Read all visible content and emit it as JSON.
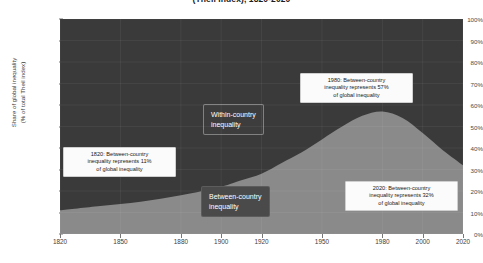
{
  "chart_data": {
    "type": "area",
    "title": "(Theil index), 1820-2020",
    "xlabel": "",
    "ylabel": "Share of global inequality (% of total Theil index)",
    "ylabel_line1": "Share of global inequality",
    "ylabel_line2": "(% of total Theil index)",
    "xlim": [
      1820,
      2020
    ],
    "ylim": [
      0,
      100
    ],
    "grid": true,
    "legend_position": "in-plot",
    "x_ticks": [
      "1820",
      "1850",
      "1880",
      "1900",
      "1920",
      "1950",
      "1980",
      "2000",
      "2020"
    ],
    "x_tick_values": [
      1820,
      1850,
      1880,
      1900,
      1920,
      1950,
      1980,
      2000,
      2020
    ],
    "y_ticks": [
      "0%",
      "10%",
      "20%",
      "30%",
      "40%",
      "50%",
      "60%",
      "70%",
      "80%",
      "90%",
      "100%"
    ],
    "y_tick_values": [
      0,
      10,
      20,
      30,
      40,
      50,
      60,
      70,
      80,
      90,
      100
    ],
    "x": [
      1820,
      1840,
      1860,
      1880,
      1900,
      1910,
      1920,
      1930,
      1940,
      1950,
      1960,
      1970,
      1980,
      1990,
      2000,
      2010,
      2020
    ],
    "series": [
      {
        "name": "Between-country inequality",
        "color": "#8a8a8a",
        "values": [
          11,
          13,
          15,
          18,
          22,
          25,
          28,
          33,
          38,
          44,
          50,
          55,
          57,
          54,
          47,
          39,
          32
        ]
      },
      {
        "name": "Within-country inequality",
        "color": "#3a3a3a",
        "values": [
          89,
          87,
          85,
          82,
          78,
          75,
          72,
          67,
          62,
          56,
          50,
          45,
          43,
          46,
          53,
          61,
          68
        ]
      }
    ],
    "annotations": [
      {
        "id": "annotation-1820",
        "line1": "1820: Between-country",
        "line2": "inequality represents 11%",
        "line3": "of global inequality",
        "year": 1820,
        "value": 11
      },
      {
        "id": "annotation-1980",
        "line1": "1980: Between-country",
        "line2": "inequality represents 57%",
        "line3": "of global inequality",
        "year": 1980,
        "value": 57
      },
      {
        "id": "annotation-2020",
        "line1": "2020: Between-country",
        "line2": "inequality represents 32%",
        "line3": "of global inequality",
        "year": 2020,
        "value": 32
      }
    ],
    "region_labels": [
      {
        "id": "within-country",
        "line1": "Within-country",
        "line2": "inequality"
      },
      {
        "id": "between-country",
        "line1": "Between-country",
        "line2": "inequality"
      }
    ]
  }
}
